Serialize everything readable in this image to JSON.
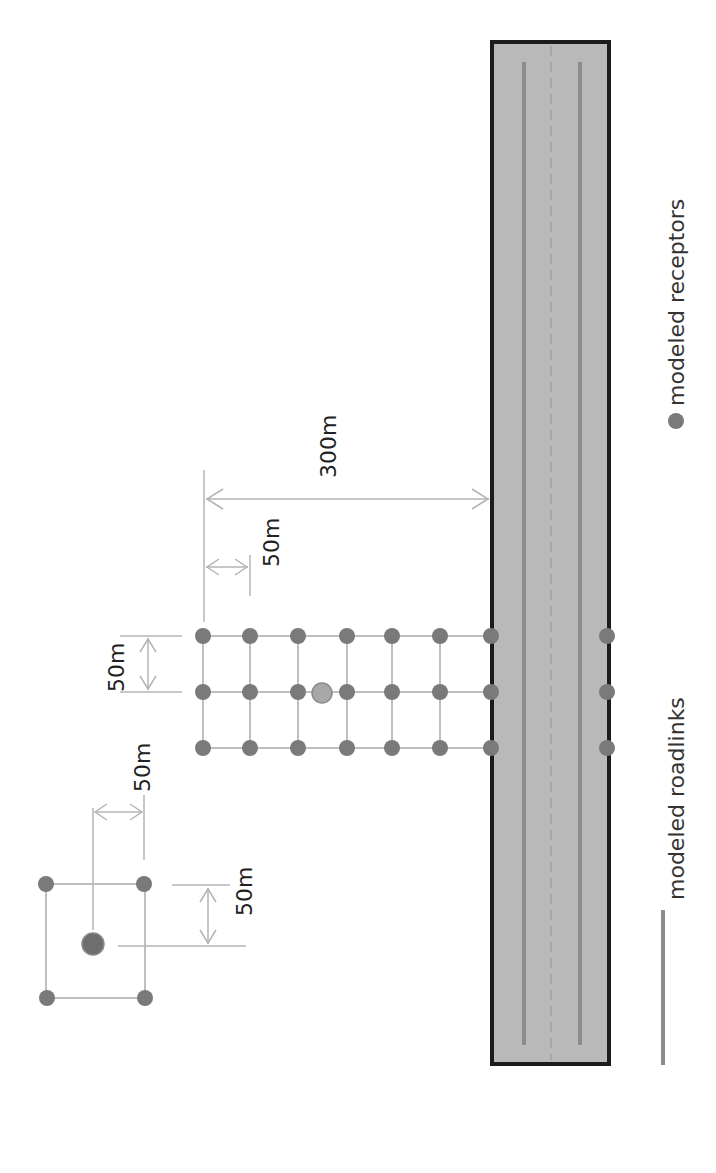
{
  "diagram": {
    "colors": {
      "receptor": "#7a7a7a",
      "highlight_receptor": "#a8a8a8",
      "road_fill": "#b9b9b9",
      "road_border": "#1c1c1c",
      "roadlink": "#8c8c8c",
      "dimension_line": "#b4b4b4"
    },
    "dimension_labels": {
      "grid_spacing_vertical": "50m",
      "grid_offset_from_start": "50m",
      "distance_to_road": "300m",
      "box_horizontal": "50m",
      "box_vertical": "50m"
    },
    "road": {
      "label": "road",
      "lanes": 2,
      "has_dashed_centerline": true
    },
    "receptor_grid": {
      "rows": 3,
      "columns_before_road": 7,
      "columns_across_road": 1,
      "spacing": "50m",
      "highlighted_point": "center receptor between columns 3 and 4 of middle row"
    },
    "source_box": {
      "corners": 4,
      "has_center_point": true,
      "size": "50m"
    },
    "legend": {
      "items": [
        {
          "symbol": "dot",
          "label": "modeled receptors"
        },
        {
          "symbol": "line",
          "label": "modeled roadlinks"
        }
      ]
    }
  }
}
